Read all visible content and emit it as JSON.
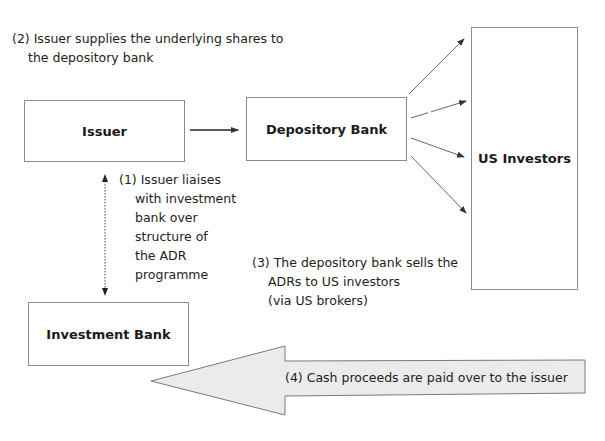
{
  "diagram": {
    "nodes": {
      "issuer": {
        "label": "Issuer"
      },
      "depository_bank": {
        "label": "Depository Bank"
      },
      "us_investors": {
        "label": "US Investors"
      },
      "investment_bank": {
        "label": "Investment Bank"
      }
    },
    "steps": {
      "step1": {
        "lines": [
          "(1) Issuer liaises",
          "with investment",
          "bank over",
          "structure of",
          "the ADR",
          "programme"
        ]
      },
      "step2": {
        "lines": [
          "(2) Issuer supplies the underlying shares to",
          "the depository bank"
        ]
      },
      "step3": {
        "lines": [
          "(3) The depository bank sells the",
          "ADRs to US investors",
          "(via US brokers)"
        ]
      },
      "step4": {
        "label": "(4) Cash proceeds are paid over to the issuer"
      }
    },
    "colors": {
      "box_border": "#8a8a8a",
      "arrow": "#333333",
      "big_arrow_fill": "#ebebeb",
      "big_arrow_border": "#7a7a7a"
    }
  }
}
